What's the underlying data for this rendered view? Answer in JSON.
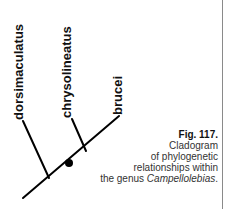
{
  "figure": {
    "number_label": "Fig. 117.",
    "caption_lines": [
      "Cladogram",
      "of phylogenetic",
      "relationships within"
    ],
    "caption_last_prefix": "the genus ",
    "caption_genus": "Campellolebias",
    "caption_last_suffix": "."
  },
  "cladogram": {
    "taxa": [
      {
        "name": "dorsimaculatus"
      },
      {
        "name": "chrysolineatus"
      },
      {
        "name": "brucei"
      }
    ],
    "node_marker": "filled-circle",
    "line_color": "#000000"
  }
}
